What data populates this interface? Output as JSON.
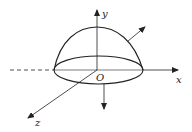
{
  "diagram": {
    "title": "",
    "type": "3D hemispherical surface with coordinate axes and normal vectors",
    "axes": {
      "x": {
        "label": "x"
      },
      "y": {
        "label": "y"
      },
      "z": {
        "label": "z"
      }
    },
    "origin": {
      "label": "O"
    },
    "surfaces": [
      {
        "name": "dome",
        "description": "upper curved surface (hemisphere-like)"
      },
      {
        "name": "base-disk",
        "description": "elliptical bottom disk in xOz plane"
      }
    ],
    "vectors": [
      {
        "name": "outward-normal-top",
        "description": "outward normal on curved surface"
      },
      {
        "name": "outward-normal-bottom",
        "description": "downward normal on base disk"
      }
    ],
    "colors": {
      "stroke": "#222222",
      "background": "#ffffff"
    }
  }
}
